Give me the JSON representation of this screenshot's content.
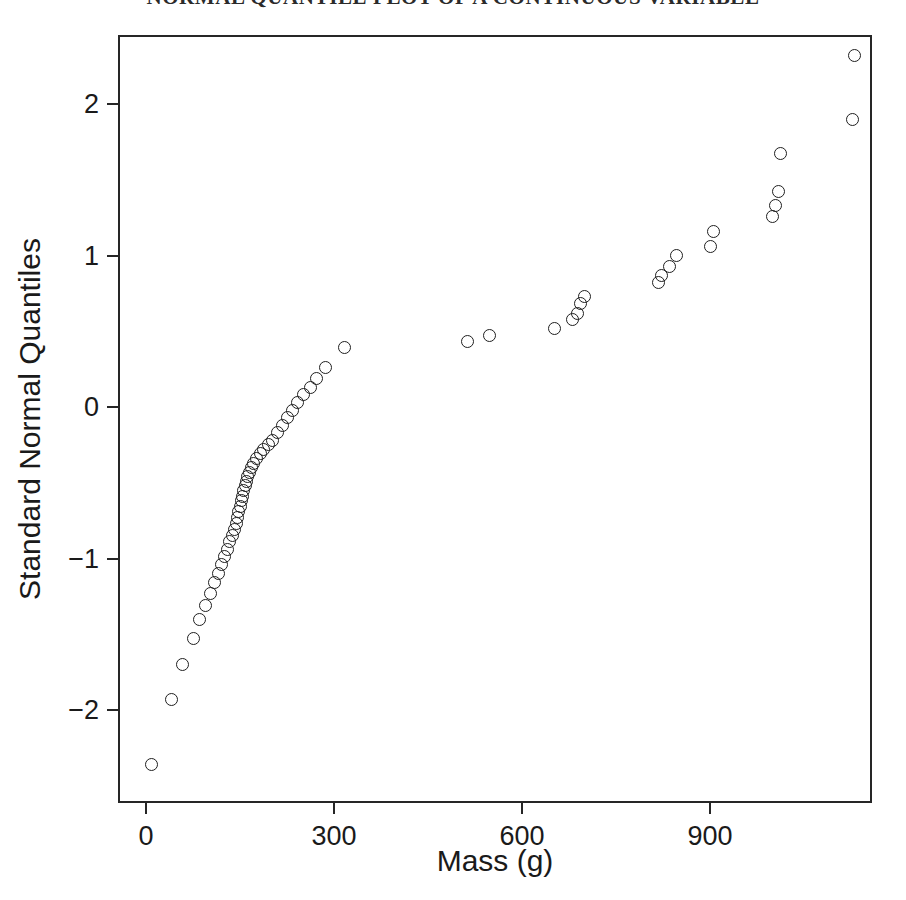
{
  "chart_data": {
    "type": "scatter",
    "title": "NORMAL QUANTILE PLOT OF A CONTINUOUS VARIABLE",
    "subtitle": "",
    "xlabel": "Mass (g)",
    "ylabel": "Standard Normal Quantiles",
    "xlim": [
      -50,
      1190
    ],
    "ylim": [
      -2.65,
      2.6
    ],
    "xticks": [
      0,
      300,
      600,
      900
    ],
    "xtick_labels": [
      "0",
      "300",
      "600",
      "900"
    ],
    "yticks": [
      -2,
      -1,
      0,
      1,
      2
    ],
    "ytick_labels": [
      "-2",
      "-1",
      "0",
      "1",
      "2"
    ],
    "grid": false,
    "legend": null,
    "marker": "open-circle",
    "marker_color": "#1f1f1f",
    "n_points": 62,
    "series": [
      {
        "name": "Mass vs Standard Normal Quantiles",
        "x": [
          8,
          40,
          58,
          75,
          86,
          95,
          103,
          110,
          116,
          121,
          126,
          130,
          134,
          138,
          141,
          144,
          146,
          148,
          150,
          152,
          154,
          156,
          158,
          160,
          162,
          165,
          168,
          172,
          177,
          182,
          188,
          195,
          202,
          210,
          218,
          226,
          234,
          242,
          252,
          262,
          272,
          286,
          316,
          513,
          548,
          652,
          681,
          688,
          694,
          700,
          818,
          822,
          836,
          846,
          900,
          905,
          1000,
          1004,
          1009,
          1013,
          1128,
          1131
        ],
        "y": [
          -2.36,
          -1.93,
          -1.7,
          -1.53,
          -1.4,
          -1.31,
          -1.23,
          -1.16,
          -1.1,
          -1.04,
          -0.99,
          -0.94,
          -0.89,
          -0.85,
          -0.81,
          -0.77,
          -0.73,
          -0.69,
          -0.66,
          -0.62,
          -0.59,
          -0.55,
          -0.52,
          -0.49,
          -0.46,
          -0.43,
          -0.4,
          -0.37,
          -0.34,
          -0.31,
          -0.28,
          -0.25,
          -0.22,
          -0.17,
          -0.12,
          -0.07,
          -0.02,
          0.03,
          0.08,
          0.13,
          0.19,
          0.26,
          0.39,
          0.43,
          0.47,
          0.52,
          0.58,
          0.62,
          0.68,
          0.73,
          0.82,
          0.87,
          0.93,
          1.0,
          1.06,
          1.16,
          1.26,
          1.33,
          1.42,
          1.67,
          1.9,
          2.32
        ]
      }
    ]
  },
  "axes": {
    "x_axis_name": "mass-axis",
    "y_axis_name": "quantile-axis"
  }
}
